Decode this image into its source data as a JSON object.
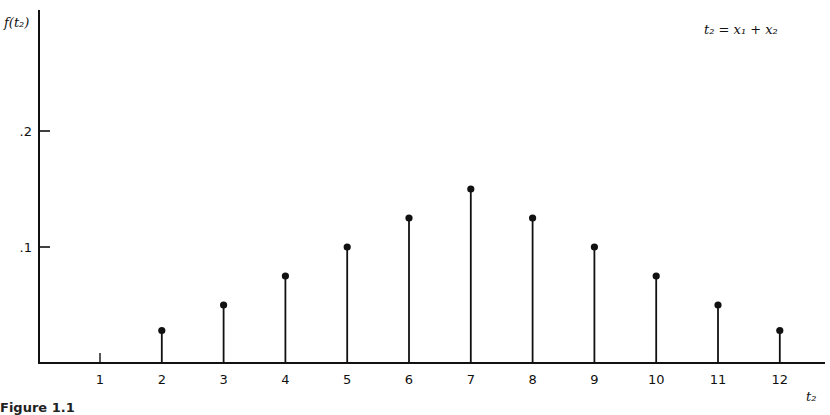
{
  "chart_data": {
    "type": "stem",
    "title": "",
    "annotation": "t₂ = x₁ + x₂",
    "xlabel": "t₂",
    "ylabel": "f(t₂)",
    "categories": [
      "1",
      "2",
      "3",
      "4",
      "5",
      "6",
      "7",
      "8",
      "9",
      "10",
      "11",
      "12"
    ],
    "x": [
      1,
      2,
      3,
      4,
      5,
      6,
      7,
      8,
      9,
      10,
      11,
      12
    ],
    "values": [
      0,
      0.028,
      0.05,
      0.075,
      0.1,
      0.125,
      0.15,
      0.125,
      0.1,
      0.075,
      0.05,
      0.028
    ],
    "yticks": [
      0.1,
      0.2
    ],
    "ytick_labels": [
      ".1",
      ".2"
    ],
    "ylim": [
      0,
      0.27
    ],
    "xlim": [
      0,
      12.7
    ],
    "grid": false,
    "legend": null
  },
  "labels": {
    "y_axis": "f(t₂)",
    "x_axis": "t₂",
    "equation": "t₂ = x₁ + x₂",
    "ytick_1": ".1",
    "ytick_2": ".2",
    "caption": "Figure 1.1"
  },
  "colors": {
    "ink": "#111111",
    "background": "#ffffff"
  }
}
